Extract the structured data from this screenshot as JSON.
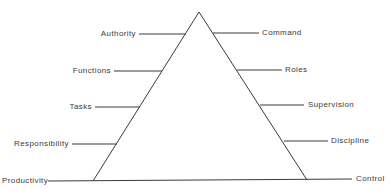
{
  "diagram": {
    "type": "triangle-with-labels",
    "left_labels": [
      {
        "id": "authority",
        "text": "Authority"
      },
      {
        "id": "functions",
        "text": "Functions"
      },
      {
        "id": "tasks",
        "text": "Tasks"
      },
      {
        "id": "responsibility",
        "text": "Responsibility"
      }
    ],
    "right_labels": [
      {
        "id": "command",
        "text": "Command"
      },
      {
        "id": "roles",
        "text": "Roles"
      },
      {
        "id": "supervision",
        "text": "Supervision"
      },
      {
        "id": "discipline",
        "text": "Discipline"
      }
    ],
    "base_left_label": "Productivity",
    "base_right_label": "Control",
    "colors": {
      "line": "#3a3a3a",
      "text": "#3a3a3a",
      "background": "#ffffff"
    }
  }
}
